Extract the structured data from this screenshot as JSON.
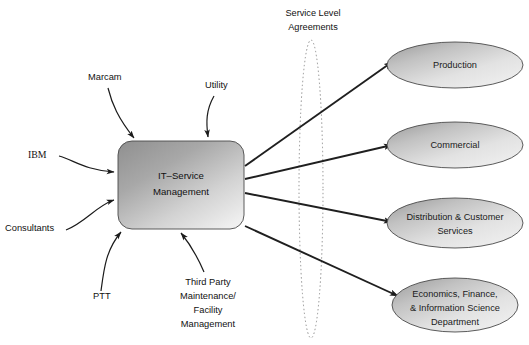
{
  "diagram": {
    "center_node": {
      "name": "center-node",
      "lines": [
        "IT–Service",
        "Management"
      ],
      "shape": "rounded-rectangle",
      "x": 118,
      "y": 141,
      "width": 126,
      "height": 88
    },
    "suppliers": [
      {
        "id": "marcam",
        "label": "Marcam",
        "font": "sans",
        "x": 88,
        "y": 80,
        "anchor": "start"
      },
      {
        "id": "utility",
        "label": "Utility",
        "font": "sans",
        "x": 205,
        "y": 88,
        "anchor": "start"
      },
      {
        "id": "ibm",
        "label": "IBM",
        "font": "serif",
        "x": 28,
        "y": 158,
        "anchor": "start"
      },
      {
        "id": "consultants",
        "label": "Consultants",
        "font": "sans",
        "x": 5,
        "y": 231,
        "anchor": "start"
      },
      {
        "id": "ptt",
        "label": "PTT",
        "font": "sans",
        "x": 93,
        "y": 299,
        "anchor": "start"
      },
      {
        "id": "third-party",
        "label_lines": [
          "Third Party",
          "Maintenance/",
          "Facility",
          "Management"
        ],
        "font": "sans",
        "x": 208,
        "y": 285,
        "anchor": "middle"
      }
    ],
    "customers": [
      {
        "id": "production",
        "lines": [
          "Production"
        ],
        "cx": 455,
        "cy": 65,
        "rx": 68,
        "ry": 23
      },
      {
        "id": "commercial",
        "lines": [
          "Commercial"
        ],
        "cx": 455,
        "cy": 145,
        "rx": 68,
        "ry": 23
      },
      {
        "id": "distribution",
        "lines": [
          "Distribution & Customer",
          "Services"
        ],
        "cx": 455,
        "cy": 223,
        "rx": 68,
        "ry": 25
      },
      {
        "id": "economics",
        "lines": [
          "Economics, Finance,",
          "& Information Science",
          "Department"
        ],
        "cx": 455,
        "cy": 305,
        "rx": 63,
        "ry": 27
      }
    ],
    "sla": {
      "id": "service-level-agreements",
      "lines": [
        "Service Level",
        "Agreements"
      ],
      "text_x": 313,
      "text_y": 16,
      "ellipse": {
        "cx": 311,
        "cy": 189,
        "rx": 12,
        "ry": 149
      }
    },
    "colors": {
      "shape_fill_dark": "#9a9a9a",
      "shape_fill_light": "#e9e9e9",
      "stroke": "#4a4a4a",
      "arrow": "#1b1b1b",
      "sla_dotted": "#8d8d8d",
      "text": "#111111",
      "background": "#ffffff"
    }
  }
}
